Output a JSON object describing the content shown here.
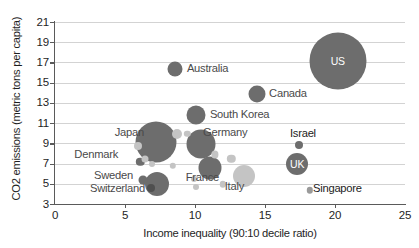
{
  "chart_data": {
    "type": "scatter",
    "title": "",
    "xlabel": "Income inequality (90:10 decile ratio)",
    "ylabel": "CO2 emissions (metric tons per capita)",
    "xlim": [
      0,
      25
    ],
    "ylim": [
      3,
      21
    ],
    "xticks": [
      "0",
      "5",
      "10",
      "15",
      "20",
      "25"
    ],
    "yticks": [
      "3",
      "5",
      "7",
      "9",
      "11",
      "13",
      "15",
      "17",
      "19",
      "21"
    ],
    "grid": "horizontal",
    "legend": "none",
    "bubble_note": "bubble area encodes a third variable (e.g. population); dark gray = labeled countries, light gray = unlabeled countries",
    "colors": {
      "bubble_dark": "#6d6d6d",
      "bubble_light": "#c4c4c4",
      "bubble_mid": "#9a9a9a",
      "gridline": "#d3d3d3",
      "axis": "#5a5a5a",
      "label_text": "#4a4a4a",
      "inner_label_text": "#ffffff",
      "background": "#ffffff"
    },
    "points": [
      {
        "name": "US",
        "x": 20.2,
        "y": 17.1,
        "r": 28.5,
        "shade": "dark",
        "label_mode": "inside",
        "label": "US"
      },
      {
        "name": "Australia",
        "x": 8.6,
        "y": 16.4,
        "r": 7.5,
        "shade": "dark",
        "label_mode": "right",
        "label": "Australia"
      },
      {
        "name": "Canada",
        "x": 14.4,
        "y": 13.9,
        "r": 8.5,
        "shade": "dark",
        "label_mode": "right",
        "label": "Canada"
      },
      {
        "name": "South Korea",
        "x": 10.1,
        "y": 11.8,
        "r": 9.5,
        "shade": "dark",
        "label_mode": "right",
        "label": "South Korea"
      },
      {
        "name": "Japan",
        "x": 7.2,
        "y": 9.1,
        "r": 20.5,
        "shade": "dark",
        "label_mode": "left",
        "label": "Japan"
      },
      {
        "name": "Germany",
        "x": 10.4,
        "y": 8.9,
        "r": 14.5,
        "shade": "dark",
        "label_mode": "right",
        "label": "Germany"
      },
      {
        "name": "Israel",
        "x": 17.4,
        "y": 8.85,
        "r": 4.0,
        "shade": "dark",
        "label_mode": "above",
        "label": "Israel"
      },
      {
        "name": "UK",
        "x": 17.3,
        "y": 7.0,
        "r": 11.0,
        "shade": "dark",
        "label_mode": "inside",
        "label": "UK"
      },
      {
        "name": "Denmark",
        "x": 6.1,
        "y": 7.15,
        "r": 4.2,
        "shade": "dark",
        "label_mode": "left",
        "label": "Denmark"
      },
      {
        "name": "France",
        "x": 11.1,
        "y": 6.6,
        "r": 11.5,
        "shade": "dark",
        "label_mode": "left",
        "label": "France"
      },
      {
        "name": "Sweden",
        "x": 6.3,
        "y": 5.35,
        "r": 4.5,
        "shade": "dark",
        "label_mode": "left",
        "label": "Sweden"
      },
      {
        "name": "Switzerland",
        "x": 7.3,
        "y": 5.0,
        "r": 12.0,
        "shade": "dark",
        "label_mode": "left",
        "label": "Switzerland"
      },
      {
        "name": "Switzerland-marker",
        "x": 6.85,
        "y": 4.55,
        "r": 4.0,
        "shade": "darker",
        "label_mode": "none",
        "label": ""
      },
      {
        "name": "Italy",
        "x": 13.5,
        "y": 5.75,
        "r": 11.0,
        "shade": "light",
        "label_mode": "left",
        "label": "Italy"
      },
      {
        "name": "Singapore",
        "x": 18.2,
        "y": 4.35,
        "r": 3.2,
        "shade": "mid",
        "label_mode": "right",
        "label": "Singapore"
      },
      {
        "name": "unlabeled-1",
        "x": 8.7,
        "y": 9.95,
        "r": 5.0,
        "shade": "light",
        "label_mode": "none",
        "label": ""
      },
      {
        "name": "unlabeled-2",
        "x": 9.45,
        "y": 9.95,
        "r": 3.2,
        "shade": "light",
        "label_mode": "none",
        "label": ""
      },
      {
        "name": "unlabeled-3",
        "x": 5.9,
        "y": 8.7,
        "r": 4.0,
        "shade": "light",
        "label_mode": "none",
        "label": ""
      },
      {
        "name": "unlabeled-4",
        "x": 6.45,
        "y": 7.5,
        "r": 3.5,
        "shade": "light",
        "label_mode": "none",
        "label": ""
      },
      {
        "name": "unlabeled-5",
        "x": 6.9,
        "y": 7.0,
        "r": 3.0,
        "shade": "light",
        "label_mode": "none",
        "label": ""
      },
      {
        "name": "unlabeled-6",
        "x": 11.4,
        "y": 7.9,
        "r": 3.6,
        "shade": "light",
        "label_mode": "none",
        "label": ""
      },
      {
        "name": "unlabeled-7",
        "x": 12.6,
        "y": 7.5,
        "r": 4.2,
        "shade": "light",
        "label_mode": "none",
        "label": ""
      },
      {
        "name": "unlabeled-8",
        "x": 8.4,
        "y": 6.75,
        "r": 3.2,
        "shade": "light",
        "label_mode": "none",
        "label": ""
      },
      {
        "name": "unlabeled-9",
        "x": 9.9,
        "y": 5.5,
        "r": 3.0,
        "shade": "light",
        "label_mode": "none",
        "label": ""
      },
      {
        "name": "unlabeled-10",
        "x": 10.1,
        "y": 4.65,
        "r": 3.0,
        "shade": "light",
        "label_mode": "none",
        "label": ""
      },
      {
        "name": "unlabeled-11",
        "x": 12.0,
        "y": 4.95,
        "r": 3.2,
        "shade": "light",
        "label_mode": "none",
        "label": ""
      }
    ]
  }
}
